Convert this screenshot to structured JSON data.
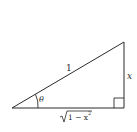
{
  "diagram": {
    "type": "right-triangle",
    "labels": {
      "hypotenuse": "1",
      "opposite": "x",
      "adjacent": "√1 − x²",
      "adjacent_radicand": "1 − x",
      "adjacent_exponent": "2",
      "angle": "θ"
    },
    "vertices": {
      "left": [
        12,
        108
      ],
      "right_bottom": [
        124,
        108
      ],
      "right_top": [
        124,
        42
      ]
    },
    "right_angle_at": "right_bottom",
    "colors": {
      "stroke": "#2a2a2a",
      "background": "#ffffff"
    }
  }
}
